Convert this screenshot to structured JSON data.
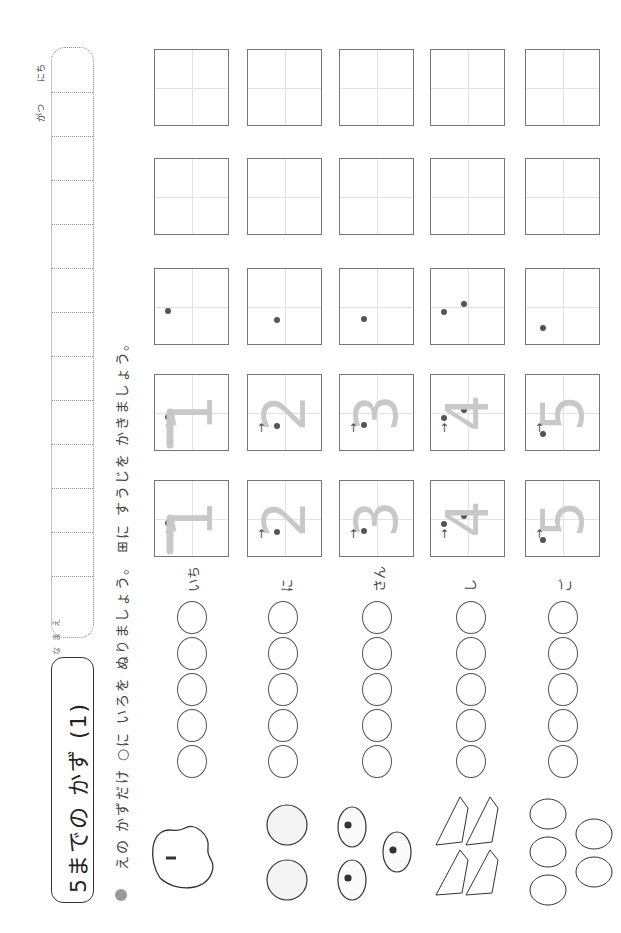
{
  "header": {
    "name_label": "なまえ",
    "date_labels": {
      "month": "がつ",
      "day": "にち"
    },
    "title": "5までの かず (1)"
  },
  "instruction": {
    "bullet": "●",
    "text": "えの かずだけ ○に いろを ぬりましょう。 ⊞に すうじを かきましょう。"
  },
  "rows": [
    {
      "reading": "いち",
      "number": "1",
      "fruit": "apple-icon",
      "fruit_count": 1,
      "circles": 5
    },
    {
      "reading": "に",
      "number": "2",
      "fruit": "melon-icon",
      "fruit_count": 2,
      "circles": 5
    },
    {
      "reading": "さん",
      "number": "3",
      "fruit": "orange-icon",
      "fruit_count": 3,
      "circles": 5
    },
    {
      "reading": "し",
      "number": "4",
      "fruit": "grapes-icon",
      "fruit_count": 4,
      "circles": 5
    },
    {
      "reading": "ご",
      "number": "5",
      "fruit": "strawberry-icon",
      "fruit_count": 5,
      "circles": 5
    }
  ],
  "writing_boxes": {
    "traced_examples_per_row": 2,
    "start_dot_boxes_per_row": 1,
    "empty_boxes_per_row": 2
  },
  "colors": {
    "trace_gray": "#c8c8c8",
    "ink": "#333333",
    "guide_line": "#e2e2e2"
  }
}
